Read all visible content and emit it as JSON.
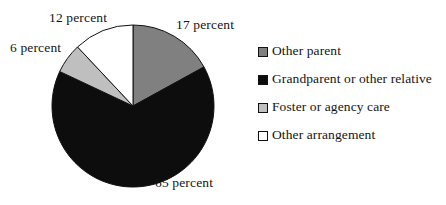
{
  "chart_data": {
    "type": "pie",
    "title": "",
    "subtitle": "",
    "xlabel": "",
    "ylabel": "",
    "grid": false,
    "legend_position": "right",
    "start_angle_deg": 0,
    "direction": "clockwise",
    "center": {
      "x": 133,
      "y": 106
    },
    "radius": 81,
    "categories": [
      "Other parent",
      "Grandparent or other relative",
      "Foster or agency care",
      "Other arrangement"
    ],
    "values": [
      17,
      65,
      6,
      12
    ],
    "value_unit": "percent",
    "data_labels": [
      "17 percent",
      "65 percent",
      "6 percent",
      "12 percent"
    ],
    "colors": [
      "#808080",
      "#0d0d0d",
      "#bfbfbf",
      "#ffffff"
    ],
    "slice_stroke": "#111111",
    "slices": [
      {
        "label": "Other parent",
        "value": 17,
        "data_label": "17 percent",
        "color": "#808080",
        "start_deg": 0,
        "end_deg": 61.2
      },
      {
        "label": "Grandparent or other relative",
        "value": 65,
        "data_label": "65 percent",
        "color": "#0d0d0d",
        "start_deg": 61.2,
        "end_deg": 295.2
      },
      {
        "label": "Foster or agency care",
        "value": 6,
        "data_label": "6 percent",
        "color": "#bfbfbf",
        "start_deg": 295.2,
        "end_deg": 316.8
      },
      {
        "label": "Other arrangement",
        "value": 12,
        "data_label": "12 percent",
        "color": "#ffffff",
        "start_deg": 316.8,
        "end_deg": 360
      }
    ]
  },
  "labels": {
    "slice_17": "17 percent",
    "slice_65": "65 percent",
    "slice_6": "6 percent",
    "slice_12": "12 percent"
  },
  "legend": {
    "items": [
      {
        "label": "Other parent",
        "color": "#808080"
      },
      {
        "label": "Grandparent or other relative",
        "color": "#0d0d0d"
      },
      {
        "label": "Foster or agency care",
        "color": "#bfbfbf"
      },
      {
        "label": "Other arrangement",
        "color": "#ffffff"
      }
    ]
  },
  "colors": {
    "background": "#ffffff",
    "text": "#141414",
    "outline": "#111111"
  }
}
